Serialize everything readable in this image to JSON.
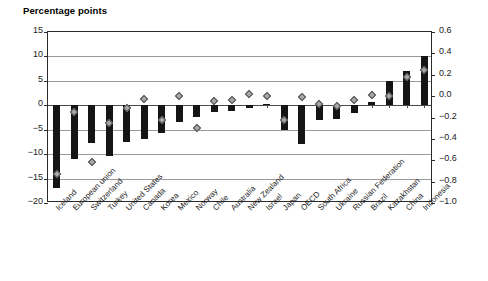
{
  "header": {
    "axis_title": "Percentage points"
  },
  "legend": {
    "position": "inside-top-center",
    "entries": [
      {
        "label": "PSE% change",
        "marker": "square-icon",
        "color": "#151515"
      },
      {
        "label": "NPC change (right axis)",
        "marker": "diamond-icon",
        "color": "#a8a8a8"
      }
    ]
  },
  "chart_data": {
    "type": "bar",
    "title": "Percentage points",
    "xlabel": "",
    "ylabel": "Percentage points",
    "ylim": [
      -20,
      15
    ],
    "y2lim": [
      -1.0,
      0.6
    ],
    "grid": true,
    "yticks": [
      "15",
      "10",
      "5",
      "0",
      "-5",
      "-10",
      "-15",
      "-20"
    ],
    "y2ticks": [
      "0.6",
      "0.4",
      "0.2",
      "0.0",
      "-0.2",
      "-0.4",
      "-0.6",
      "-0.8",
      "-1.0"
    ],
    "categories": [
      "Iceland",
      "European union",
      "Switzerland",
      "Turkey",
      "United States",
      "Canada",
      "Korea",
      "Mexico",
      "Norway",
      "Chile",
      "Australia",
      "New Zealand",
      "Israel",
      "Japan",
      "OECD",
      "South Africa",
      "Ukraine",
      "Russian Federation",
      "Brazil",
      "Kazakhstan",
      "China",
      "Indonesia"
    ],
    "series": [
      {
        "name": "PSE% change",
        "axis": "left",
        "type": "bar",
        "color": "#151515",
        "values": [
          -17.0,
          -11.0,
          -7.7,
          -10.3,
          -7.5,
          -7.0,
          -5.7,
          -3.4,
          -2.5,
          -1.4,
          -1.2,
          -0.6,
          0.2,
          -5.0,
          -8.0,
          -3.0,
          -2.8,
          -1.5,
          0.6,
          5.0,
          7.0,
          10.0
        ]
      },
      {
        "name": "NPC change (right axis)",
        "axis": "right",
        "type": "scatter",
        "color": "#a8a8a8",
        "values": [
          -0.73,
          -0.15,
          -0.62,
          -0.25,
          -0.11,
          -0.03,
          -0.22,
          0.0,
          -0.3,
          -0.05,
          -0.04,
          0.02,
          0.0,
          -0.22,
          -0.01,
          -0.07,
          -0.09,
          -0.04,
          0.01,
          0.0,
          0.18,
          0.24
        ]
      }
    ]
  }
}
